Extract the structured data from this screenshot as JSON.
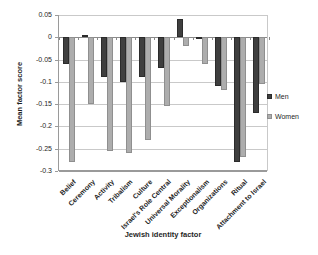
{
  "chart_data": {
    "type": "bar",
    "title": "",
    "xlabel": "Jewish identity factor",
    "ylabel": "Mean factor score",
    "categories": [
      "Belief",
      "Ceremony",
      "Activity",
      "Tribalism",
      "Culture",
      "Israel's Role Central",
      "Universal Morality",
      "Exceptionalism",
      "Organizations",
      "Ritual",
      "Attachment to Israel"
    ],
    "series": [
      {
        "name": "Men",
        "color": "#3f3f3f",
        "border": "#2b2b2b",
        "values": [
          -0.06,
          0.005,
          -0.09,
          -0.1,
          -0.09,
          -0.07,
          0.04,
          -0.005,
          -0.11,
          -0.28,
          -0.17
        ]
      },
      {
        "name": "Women",
        "color": "#adadad",
        "border": "#8f8f8f",
        "values": [
          -0.28,
          -0.15,
          -0.255,
          -0.26,
          -0.23,
          -0.155,
          -0.02,
          -0.06,
          -0.12,
          -0.27,
          -0.105
        ]
      }
    ],
    "ylim": [
      -0.3,
      0.05
    ],
    "ytick_step": 0.05,
    "ytick_labels": [
      "0.05",
      "0",
      "-0.05",
      "-0.1",
      "-0.15",
      "-0.2",
      "-0.25",
      "-0.3"
    ],
    "grid": true,
    "legend_position": "right",
    "bar_orientation": "vertical"
  }
}
